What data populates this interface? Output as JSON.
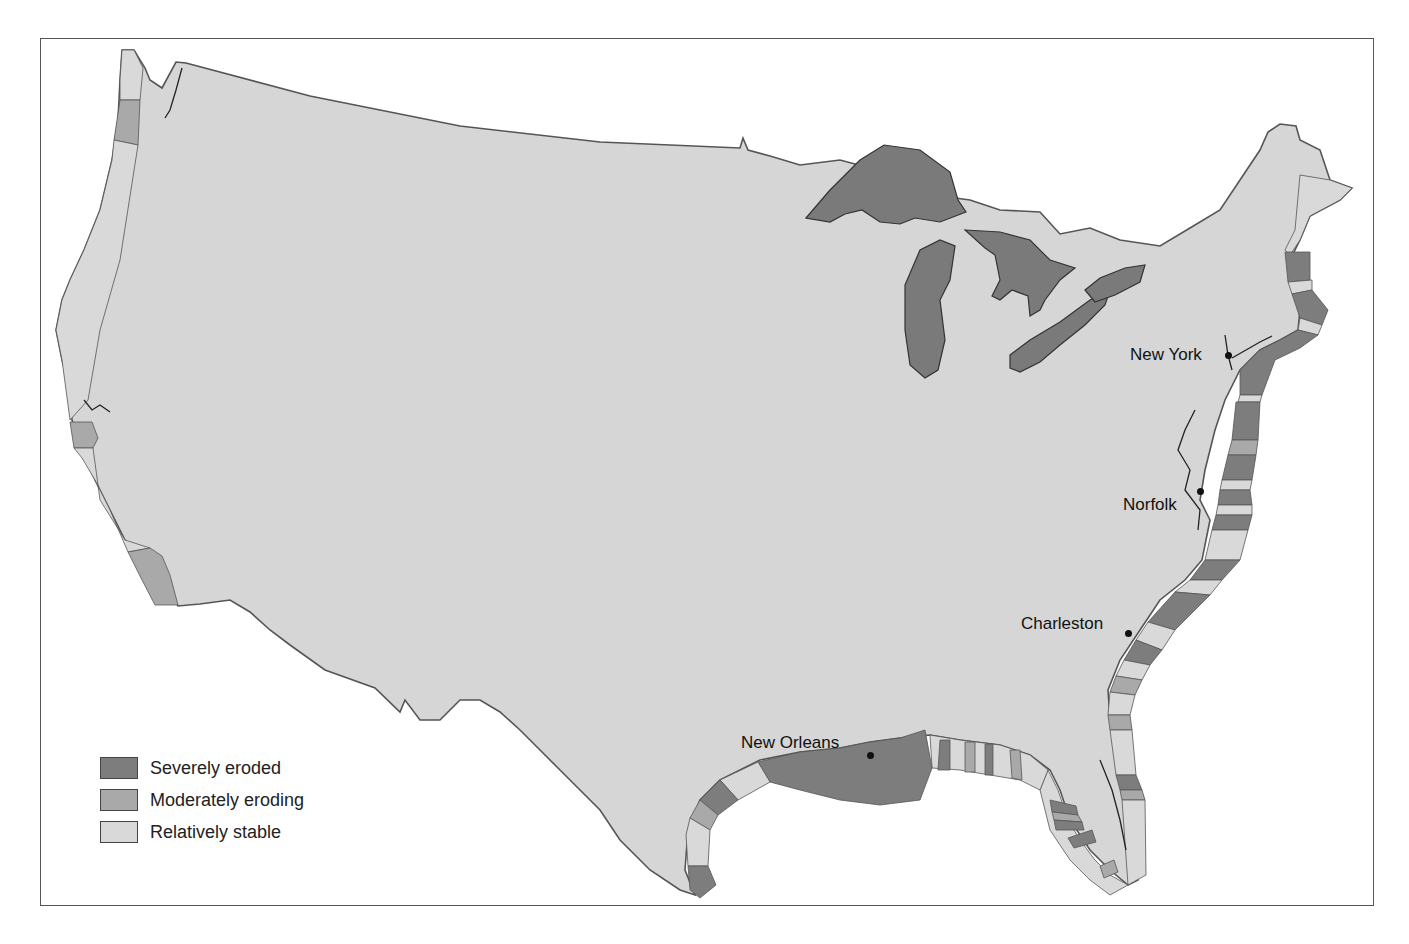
{
  "map": {
    "subject": "Coastal erosion of the contiguous United States",
    "colors": {
      "land": "#d6d6d6",
      "severely_eroded": "#7d7d7d",
      "moderately_eroding": "#a9a9a9",
      "relatively_stable": "#d9d9d9",
      "great_lakes": "#7a7a7a",
      "outline": "#555555"
    },
    "cities": [
      {
        "name": "New York",
        "label": "New York"
      },
      {
        "name": "Norfolk",
        "label": "Norfolk"
      },
      {
        "name": "Charleston",
        "label": "Charleston"
      },
      {
        "name": "New Orleans",
        "label": "New Orleans"
      }
    ],
    "legend": {
      "items": [
        {
          "label": "Severely eroded",
          "color": "#7d7d7d"
        },
        {
          "label": "Moderately eroding",
          "color": "#a9a9a9"
        },
        {
          "label": "Relatively stable",
          "color": "#d9d9d9"
        }
      ]
    }
  }
}
